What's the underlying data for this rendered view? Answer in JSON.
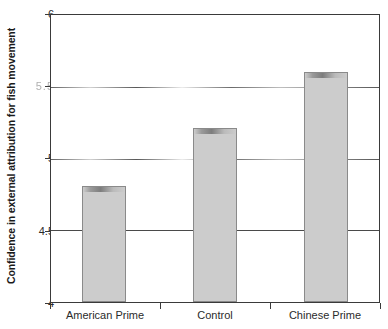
{
  "chart_data": {
    "type": "bar",
    "title": "",
    "subtitle": "",
    "xlabel": "",
    "ylabel": "Confidence in external attribution for fish movement",
    "categories": [
      "American Prime",
      "Control",
      "Chinese Prime"
    ],
    "values": [
      4.81,
      5.21,
      5.6
    ],
    "series": [
      {
        "name": "Confidence in external attribution",
        "values": [
          4.81,
          5.21,
          5.6
        ]
      }
    ],
    "ylim": [
      4,
      6
    ],
    "yticks": [
      4,
      4.5,
      5,
      5.5,
      6
    ],
    "ytick_labels": [
      "4",
      "4.5",
      "5",
      "5.5",
      "6"
    ],
    "grid": true,
    "grid_axis": "y",
    "legend": false,
    "legend_position": "none",
    "bar_fill_color": "#cccccc",
    "bar_edge_color": "#8a8a8a",
    "axis_color": "#3a3a3a",
    "background_color": "#ffffff"
  },
  "axis": {
    "y_title": "Confidence in external attribution for fish movement",
    "y_ticks": [
      {
        "label": "6",
        "value": 6,
        "degraded": false
      },
      {
        "label": "5.5",
        "value": 5.5,
        "degraded": true
      },
      {
        "label": "5",
        "value": 5,
        "degraded": false
      },
      {
        "label": "4.5",
        "value": 4.5,
        "degraded": false
      },
      {
        "label": "4",
        "value": 4,
        "degraded": false
      }
    ],
    "x_ticks": [
      {
        "label": "American Prime"
      },
      {
        "label": "Control"
      },
      {
        "label": "Chinese Prime"
      }
    ]
  }
}
